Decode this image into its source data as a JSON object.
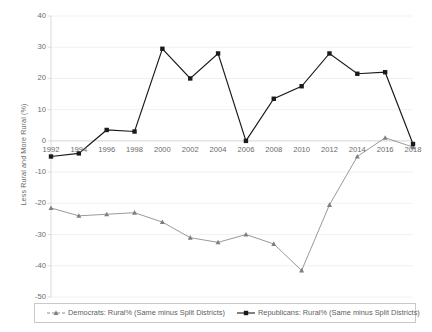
{
  "chart_data": {
    "type": "line",
    "title": "",
    "xlabel": "",
    "ylabel": "Less Rural and More Rural (%)",
    "x": [
      1992,
      1994,
      1996,
      1998,
      2000,
      2002,
      2004,
      2006,
      2008,
      2010,
      2012,
      2014,
      2016,
      2018
    ],
    "xtick_labels": [
      "1992",
      "1994",
      "1996",
      "1998",
      "2000",
      "2002",
      "2004",
      "2006",
      "2008",
      "2010",
      "2012",
      "2014",
      "2016",
      "2018"
    ],
    "ytick_labels": [
      "40",
      "30",
      "20",
      "10",
      "0",
      "-10",
      "-20",
      "-30",
      "-40",
      "-50"
    ],
    "yticks": [
      40,
      30,
      20,
      10,
      0,
      -10,
      -20,
      -30,
      -40,
      -50
    ],
    "ylim": [
      -50,
      40
    ],
    "xlim": [
      1992,
      2018
    ],
    "grid": true,
    "legend_position": "bottom",
    "series": [
      {
        "name": "Democrats: Rural% (Same minus Split Districts)",
        "color": "#7f7f7f",
        "marker": "triangle",
        "values": [
          -21.5,
          -24.0,
          -23.5,
          -23.0,
          -26.0,
          -31.0,
          -32.5,
          -30.0,
          -33.0,
          -41.5,
          -20.5,
          -5.0,
          1.0,
          -2.0
        ]
      },
      {
        "name": "Republicans: Rural% (Same minus Split Districts)",
        "color": "#1a1a1a",
        "marker": "square",
        "values": [
          -5.0,
          -4.0,
          3.5,
          3.0,
          29.5,
          20.0,
          28.0,
          0.0,
          13.5,
          17.5,
          28.0,
          21.5,
          22.0,
          -1.0
        ]
      }
    ]
  },
  "legend": {
    "democrats_label": "Democrats: Rural% (Same minus Split Districts)",
    "republicans_label": "Republicans: Rural% (Same minus Split Districts)"
  },
  "colors": {
    "democrats": "#7f7f7f",
    "republicans": "#1a1a1a",
    "axis": "#d9d9d9",
    "grid": "#ededed",
    "text": "#6b6b6b"
  }
}
